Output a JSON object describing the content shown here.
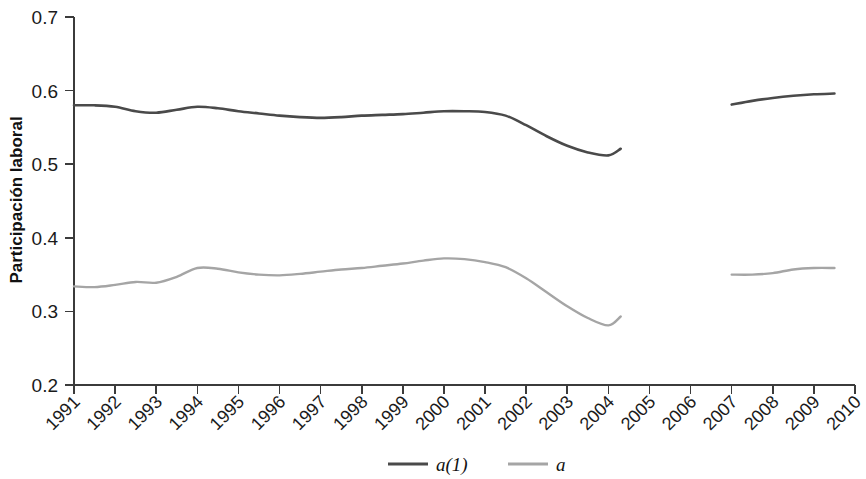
{
  "chart_data": {
    "type": "line",
    "title": "",
    "xlabel": "",
    "ylabel": "Participación laboral",
    "ylim": [
      0.2,
      0.7
    ],
    "xlim": [
      1991,
      2010
    ],
    "yticks": [
      "0.2",
      "0.3",
      "0.4",
      "0.5",
      "0.6",
      "0.7"
    ],
    "ytick_values": [
      0.2,
      0.3,
      0.4,
      0.5,
      0.6,
      0.7
    ],
    "categories": [
      "1991",
      "1992",
      "1993",
      "1994",
      "1995",
      "1996",
      "1997",
      "1998",
      "1999",
      "2000",
      "2001",
      "2002",
      "2003",
      "2004",
      "2005",
      "2006",
      "2007",
      "2008",
      "2009",
      "2010"
    ],
    "grid": false,
    "legend_position": "bottom",
    "series": [
      {
        "name": "a(1)",
        "color": "#4a4a4a",
        "width": 2.6,
        "segments": [
          {
            "x": [
              1991.0,
              1991.5,
              1992.0,
              1992.5,
              1993.0,
              1993.5,
              1994.0,
              1994.5,
              1995.0,
              1995.5,
              1996.0,
              1996.5,
              1997.0,
              1997.5,
              1998.0,
              1998.5,
              1999.0,
              1999.5,
              2000.0,
              2000.5,
              2001.0,
              2001.5,
              2002.0,
              2002.5,
              2003.0,
              2003.5,
              2004.0,
              2004.3
            ],
            "y": [
              0.58,
              0.58,
              0.578,
              0.572,
              0.57,
              0.574,
              0.578,
              0.576,
              0.572,
              0.569,
              0.566,
              0.564,
              0.563,
              0.564,
              0.566,
              0.567,
              0.568,
              0.57,
              0.572,
              0.572,
              0.571,
              0.566,
              0.553,
              0.538,
              0.525,
              0.516,
              0.512,
              0.521
            ]
          },
          {
            "x": [
              2007.0,
              2007.5,
              2008.0,
              2008.5,
              2009.0,
              2009.5
            ],
            "y": [
              0.581,
              0.586,
              0.59,
              0.593,
              0.595,
              0.596
            ]
          }
        ]
      },
      {
        "name": "a",
        "color": "#a5a5a5",
        "width": 2.4,
        "segments": [
          {
            "x": [
              1991.0,
              1991.5,
              1992.0,
              1992.5,
              1993.0,
              1993.5,
              1994.0,
              1994.5,
              1995.0,
              1995.5,
              1996.0,
              1996.5,
              1997.0,
              1997.5,
              1998.0,
              1998.5,
              1999.0,
              1999.5,
              2000.0,
              2000.5,
              2001.0,
              2001.5,
              2002.0,
              2002.5,
              2003.0,
              2003.5,
              2004.0,
              2004.3
            ],
            "y": [
              0.334,
              0.333,
              0.336,
              0.34,
              0.339,
              0.347,
              0.359,
              0.358,
              0.353,
              0.35,
              0.349,
              0.351,
              0.354,
              0.357,
              0.359,
              0.362,
              0.365,
              0.369,
              0.372,
              0.371,
              0.367,
              0.36,
              0.345,
              0.326,
              0.307,
              0.291,
              0.281,
              0.293
            ]
          },
          {
            "x": [
              2007.0,
              2007.5,
              2008.0,
              2008.5,
              2009.0,
              2009.5
            ],
            "y": [
              0.35,
              0.35,
              0.352,
              0.357,
              0.359,
              0.359
            ]
          }
        ]
      }
    ],
    "legend": [
      {
        "label": "a(1)",
        "color": "#4a4a4a"
      },
      {
        "label": "a",
        "color": "#a5a5a5"
      }
    ]
  }
}
